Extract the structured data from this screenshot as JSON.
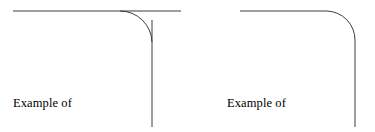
{
  "figure": {
    "background_color": "#ffffff",
    "stroke_color": "#3c3c41",
    "stroke_width": 1,
    "text_color": "#000000",
    "width": 375,
    "height": 132
  },
  "panels": [
    {
      "id": "not-trimming",
      "label_line1": "Example of",
      "label_line2": "not trimming",
      "trimmed": false,
      "horizontal_line": {
        "x1": 13,
        "y1": 11,
        "x2": 181,
        "y2": 11
      },
      "vertical_line": {
        "x1": 152,
        "y1": 20,
        "x2": 152,
        "y2": 127
      },
      "corner_arc": {
        "start_x": 120,
        "start_y": 11,
        "end_x": 152,
        "end_y": 42,
        "radius": 32
      },
      "overshoot_note": "lines extend past the fillet arc endpoints"
    },
    {
      "id": "trimming",
      "label_line1": "Example of",
      "label_line2": "trimming",
      "trimmed": true,
      "horizontal_line": {
        "x1": 240,
        "y1": 11,
        "x2": 327,
        "y2": 11
      },
      "vertical_line": {
        "x1": 355,
        "y1": 40,
        "x2": 355,
        "y2": 127
      },
      "corner_arc": {
        "start_x": 327,
        "start_y": 11,
        "end_x": 355,
        "end_y": 40,
        "radius": 29
      },
      "overshoot_note": "lines stop exactly at the fillet arc endpoints"
    }
  ]
}
